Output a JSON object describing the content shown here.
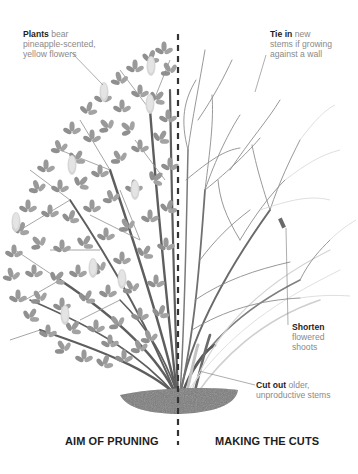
{
  "diagram": {
    "divider": {
      "style": "dashed",
      "color": "#333333",
      "x": 178
    },
    "colors": {
      "foliage": "#9a9a9a",
      "foliage_dark": "#7f7f7f",
      "flower": "#d8d8d8",
      "stem_dark": "#5a5a5a",
      "stem_light": "#b5b5b5",
      "twig": "#8c8c8c",
      "soil": "#7d7d7d",
      "text_bold": "#1e1e1e",
      "text_regular": "#8a8a8a"
    },
    "annotations": [
      {
        "id": "plants",
        "bold": "Plants",
        "rest_line1": " bear",
        "line2": "pineapple-scented,",
        "line3": "yellow flowers"
      },
      {
        "id": "tie-in",
        "bold": "Tie in",
        "rest_line1": " new",
        "line2": "stems if growing",
        "line3": "against a wall"
      },
      {
        "id": "shorten",
        "bold": "Shorten",
        "line2": "flowered",
        "line3": "shoots"
      },
      {
        "id": "cut-out",
        "bold": "Cut out",
        "rest_line1": " older,",
        "line2": "unproductive stems"
      }
    ],
    "captions": {
      "left": "AIM OF PRUNING",
      "right": "MAKING THE CUTS"
    }
  }
}
